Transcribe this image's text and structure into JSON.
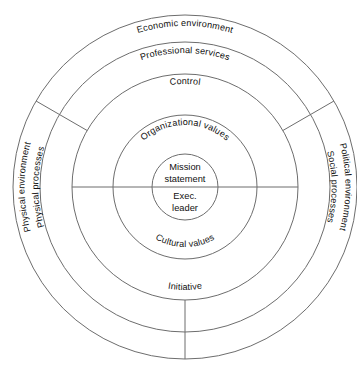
{
  "diagram": {
    "type": "concentric-circles",
    "geometry": {
      "center_x": 185,
      "center_y": 187,
      "ring_radii": [
        172,
        145,
        113,
        72,
        33
      ]
    },
    "colors": {
      "stroke": "#6d6d6d",
      "text": "#111111",
      "background": "#ffffff"
    },
    "rings": [
      {
        "index": 1,
        "name": "outer-environment-ring",
        "radius": 172,
        "labels": {
          "top": "Economic environment",
          "left": "Physical environment",
          "right": "Political environment"
        }
      },
      {
        "index": 2,
        "name": "services-processes-ring",
        "radius": 145,
        "labels": {
          "top": "Professional services",
          "left": "Physical processes",
          "right": "Social processes"
        }
      },
      {
        "index": 3,
        "name": "control-initiative-ring",
        "radius": 113,
        "labels": {
          "top": "Control",
          "bottom": "Initiative"
        }
      },
      {
        "index": 4,
        "name": "values-ring",
        "radius": 72,
        "labels": {
          "top": "Organizational values",
          "bottom": "Cultural values"
        }
      },
      {
        "index": 5,
        "name": "core-circle",
        "radius": 33,
        "labels": {
          "top_line_1": "Mission",
          "top_line_2": "statement",
          "bottom_line_1": "Exec.",
          "bottom_line_2": "leader"
        }
      }
    ],
    "dividers": [
      {
        "name": "radial-divider-upper-left",
        "angle_deg": 150
      },
      {
        "name": "radial-divider-upper-right",
        "angle_deg": 30
      },
      {
        "name": "radial-divider-bottom",
        "angle_deg": 270
      },
      {
        "name": "horizontal-diameter",
        "angle_deg": 0
      }
    ]
  }
}
